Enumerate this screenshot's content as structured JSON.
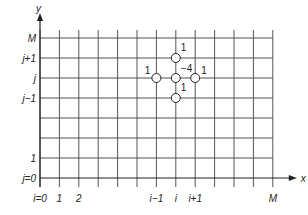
{
  "diagram": {
    "type": "finite-difference-grid",
    "axes": {
      "x_label": "x",
      "y_label": "y"
    },
    "x_ticks": [
      {
        "label": "i=0",
        "col": 0
      },
      {
        "label": "1",
        "col": 1
      },
      {
        "label": "2",
        "col": 2
      },
      {
        "label": "i−1",
        "col": 6
      },
      {
        "label": "i",
        "col": 7
      },
      {
        "label": "i+1",
        "col": 8
      },
      {
        "label": "M",
        "col": 12
      }
    ],
    "y_ticks": [
      {
        "label": "j=0",
        "row": 0
      },
      {
        "label": "1",
        "row": 1
      },
      {
        "label": "j−1",
        "row": 4
      },
      {
        "label": "j",
        "row": 5
      },
      {
        "label": "j+1",
        "row": 6
      },
      {
        "label": "M",
        "row": 7
      }
    ],
    "stencil": {
      "center": {
        "col": 7,
        "row": 5,
        "weight": "−4"
      },
      "neighbors": [
        {
          "name": "top",
          "col": 7,
          "row": 6,
          "weight": "1"
        },
        {
          "name": "bottom",
          "col": 7,
          "row": 4,
          "weight": "1"
        },
        {
          "name": "left",
          "col": 6,
          "row": 5,
          "weight": "1"
        },
        {
          "name": "right",
          "col": 8,
          "row": 5,
          "weight": "1"
        }
      ]
    },
    "colors": {
      "line": "#555555",
      "axis": "#222222",
      "node_fill": "#ffffff"
    }
  }
}
